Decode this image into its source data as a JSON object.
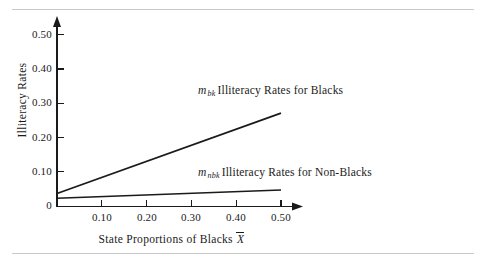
{
  "figure": {
    "top_rule": "",
    "bottom_rule": ""
  },
  "chart_data": {
    "type": "line",
    "title": "",
    "xlabel": "State Proportions of Blacks",
    "xlabel_symbol": "X",
    "ylabel": "Illiteracy Rates",
    "xlim": [
      0,
      0.55
    ],
    "ylim": [
      0,
      0.55
    ],
    "grid": false,
    "legend_position": "inline-annotations",
    "x_ticks": [
      "0.10",
      "0.20",
      "0.30",
      "0.40",
      "0.50"
    ],
    "x_tick_values": [
      0.1,
      0.2,
      0.3,
      0.4,
      0.5
    ],
    "y_ticks": [
      "0.10",
      "0.20",
      "0.30",
      "0.40",
      "0.50"
    ],
    "y_tick_values": [
      0.1,
      0.2,
      0.3,
      0.4,
      0.5
    ],
    "origin_label": "0",
    "x": [
      0.0,
      0.5
    ],
    "series": [
      {
        "name": "m_bk Illiteracy Rates for Blacks",
        "symbol": "m",
        "subscript": "bk",
        "label_text": "Illiteracy Rates for Blacks",
        "values": [
          0.038,
          0.272
        ],
        "intercept": 0.038,
        "slope": 0.468
      },
      {
        "name": "m_nbk Illiteracy Rates for Non-Blacks",
        "symbol": "m",
        "subscript": "nbk",
        "label_text": "Illiteracy Rates for Non-Blacks",
        "values": [
          0.024,
          0.048
        ],
        "intercept": 0.024,
        "slope": 0.048
      }
    ]
  }
}
